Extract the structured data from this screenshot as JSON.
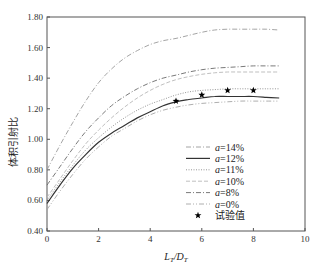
{
  "chart_data": {
    "type": "line",
    "title": "",
    "xlabel": "L_T/D_T",
    "xlabel_main": "L",
    "xlabel_sub1": "T",
    "xlabel_mid": "/D",
    "xlabel_sub2": "T",
    "ylabel": "体积引射比",
    "xlim": [
      0,
      10
    ],
    "ylim": [
      0.4,
      1.8
    ],
    "xticks": [
      "0",
      "2",
      "4",
      "6",
      "8",
      "10"
    ],
    "yticks": [
      "0.40",
      "0.60",
      "0.80",
      "1.00",
      "1.20",
      "1.40",
      "1.60",
      "1.80"
    ],
    "grid": false,
    "legend_position": "lower right (inside)",
    "x": [
      0,
      0.5,
      1,
      1.5,
      2,
      2.5,
      3,
      3.5,
      4,
      4.5,
      5,
      5.5,
      6,
      6.5,
      7,
      7.5,
      8,
      8.5,
      9
    ],
    "series": [
      {
        "name": "a=14%",
        "style": "dash-dot",
        "color": "#9a9a9a",
        "values": [
          0.8,
          0.96,
          1.11,
          1.25,
          1.37,
          1.46,
          1.53,
          1.58,
          1.62,
          1.645,
          1.66,
          1.68,
          1.7,
          1.715,
          1.72,
          1.72,
          1.72,
          1.72,
          1.715
        ]
      },
      {
        "name": "a=12%",
        "style": "solid",
        "color": "#333333",
        "values": [
          0.58,
          0.7,
          0.81,
          0.9,
          0.98,
          1.04,
          1.09,
          1.14,
          1.18,
          1.22,
          1.245,
          1.26,
          1.27,
          1.28,
          1.28,
          1.28,
          1.28,
          1.275,
          1.27
        ]
      },
      {
        "name": "a=11%",
        "style": "dotted",
        "color": "#8a8a8a",
        "values": [
          0.6,
          0.72,
          0.83,
          0.93,
          1.01,
          1.08,
          1.14,
          1.19,
          1.23,
          1.26,
          1.29,
          1.31,
          1.32,
          1.325,
          1.33,
          1.33,
          1.33,
          1.33,
          1.33
        ]
      },
      {
        "name": "a=10%",
        "style": "dashed",
        "color": "#b8b8b8",
        "values": [
          0.62,
          0.74,
          0.86,
          0.97,
          1.06,
          1.14,
          1.21,
          1.27,
          1.32,
          1.36,
          1.39,
          1.41,
          1.425,
          1.435,
          1.44,
          1.44,
          1.44,
          1.44,
          1.44
        ]
      },
      {
        "name": "a=8%",
        "style": "dash-dot",
        "color": "#6a6a6a",
        "values": [
          0.7,
          0.82,
          0.94,
          1.05,
          1.14,
          1.22,
          1.28,
          1.33,
          1.37,
          1.4,
          1.42,
          1.44,
          1.455,
          1.465,
          1.47,
          1.475,
          1.48,
          1.48,
          1.48
        ]
      },
      {
        "name": "a=0%",
        "style": "dash-dot-dot",
        "color": "#a5a5a5",
        "values": [
          0.54,
          0.66,
          0.77,
          0.87,
          0.95,
          1.02,
          1.07,
          1.12,
          1.16,
          1.19,
          1.21,
          1.225,
          1.235,
          1.24,
          1.245,
          1.25,
          1.25,
          1.25,
          1.25
        ]
      }
    ],
    "scatter": {
      "name": "试验值",
      "marker": "star",
      "color": "#000000",
      "points": [
        [
          5,
          1.25
        ],
        [
          6,
          1.29
        ],
        [
          7,
          1.32
        ],
        [
          8,
          1.32
        ]
      ]
    }
  },
  "legend": {
    "items": [
      {
        "label": "a=14%",
        "prefix": "a",
        "suffix": "=14%"
      },
      {
        "label": "a=12%",
        "prefix": "a",
        "suffix": "=12%"
      },
      {
        "label": "a=11%",
        "prefix": "a",
        "suffix": "=11%"
      },
      {
        "label": "a=10%",
        "prefix": "a",
        "suffix": "=10%"
      },
      {
        "label": "a=8%",
        "prefix": "a",
        "suffix": "=8%"
      },
      {
        "label": "a=0%",
        "prefix": "a",
        "suffix": "=0%"
      },
      {
        "label": "试验值"
      }
    ]
  }
}
